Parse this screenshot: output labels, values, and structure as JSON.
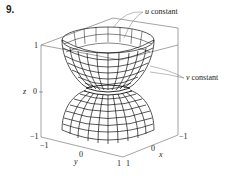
{
  "problem_number": "9.",
  "annotations": {
    "u_label": "u constant",
    "v_label": "v constant",
    "u_var": "u",
    "v_var": "v",
    "word": "constant"
  },
  "axes": {
    "z": {
      "label": "z",
      "ticks": [
        "1",
        "0",
        "−1"
      ]
    },
    "y": {
      "label": "y",
      "ticks": [
        "−1",
        "0",
        "1"
      ]
    },
    "x": {
      "label": "x",
      "ticks": [
        "1",
        "0",
        "−1"
      ]
    }
  },
  "surface": {
    "description": "Wireframe parametric surface shaped like an hourglass (upper bowl and lower dome meeting at a narrow waist at z=0), drawn inside a bounding box",
    "line_color": "#111111",
    "box_color": "#555555"
  }
}
